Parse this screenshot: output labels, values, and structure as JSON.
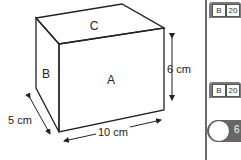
{
  "figure": {
    "faces": {
      "front": "A",
      "side": "B",
      "top": "C"
    },
    "dimensions": {
      "height": "6 cm",
      "depth": "5 cm",
      "width": "10 cm"
    }
  },
  "sidebar": {
    "badges": [
      {
        "left_page": "B",
        "right_page": "20"
      },
      {
        "left_page": "B",
        "right_page": "20"
      }
    ],
    "bubble_text": "6"
  }
}
